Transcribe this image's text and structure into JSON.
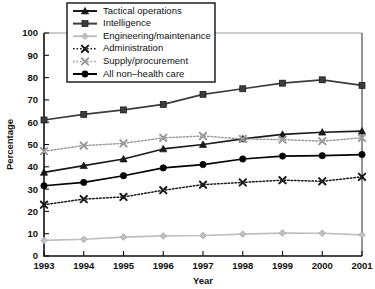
{
  "chart_data": {
    "type": "line",
    "title": "",
    "xlabel": "Year",
    "ylabel": "Percentage",
    "categories": [
      "1993",
      "1994",
      "1995",
      "1996",
      "1997",
      "1998",
      "1999",
      "2000",
      "2001"
    ],
    "x": [
      1993,
      1994,
      1995,
      1996,
      1997,
      1998,
      1999,
      2000,
      2001
    ],
    "ylim": [
      0,
      100
    ],
    "yticks": [
      0,
      10,
      20,
      30,
      40,
      50,
      60,
      70,
      80,
      90,
      100
    ],
    "grid": false,
    "legend_position": "top-center",
    "series": [
      {
        "name": "Tactical operations",
        "marker": "triangle",
        "color": "#1a1a1a",
        "linestyle": "solid",
        "values": [
          37.5,
          40.5,
          43.5,
          48.0,
          50.0,
          52.5,
          54.5,
          55.5,
          56.0
        ]
      },
      {
        "name": "Intelligence",
        "marker": "square",
        "color": "#3d3d3d",
        "linestyle": "solid",
        "values": [
          61.0,
          63.5,
          65.5,
          68.0,
          72.5,
          75.0,
          77.5,
          79.0,
          76.5
        ]
      },
      {
        "name": "Engineering/maintenance",
        "marker": "diamond",
        "color": "#bfbfbf",
        "linestyle": "solid",
        "values": [
          7.0,
          7.5,
          8.5,
          9.0,
          9.2,
          9.8,
          10.3,
          10.2,
          9.5
        ]
      },
      {
        "name": "Administration",
        "marker": "x",
        "color": "#1a1a1a",
        "linestyle": "dotted",
        "values": [
          23.0,
          25.5,
          26.5,
          29.5,
          32.0,
          33.0,
          34.0,
          33.5,
          35.5
        ]
      },
      {
        "name": "Supply/procurement",
        "marker": "x",
        "color": "#9a9a9a",
        "linestyle": "dotted",
        "values": [
          47.0,
          49.5,
          50.5,
          53.0,
          53.8,
          52.5,
          52.2,
          51.5,
          53.0
        ]
      },
      {
        "name": "All non–health care",
        "marker": "circle",
        "color": "#000000",
        "linestyle": "solid",
        "values": [
          31.5,
          33.0,
          36.0,
          39.5,
          41.0,
          43.5,
          44.8,
          45.0,
          45.5
        ]
      }
    ]
  }
}
